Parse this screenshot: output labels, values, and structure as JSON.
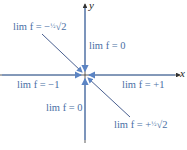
{
  "diagram": {
    "axes": {
      "x_label": "x",
      "y_label": "y"
    },
    "colors": {
      "path": "#5b84c4",
      "axis": "#333333",
      "label": "#4a6fa5"
    },
    "labels": {
      "upper_left": {
        "prefix": "lim f = −",
        "frac": "½",
        "suffix": "√2"
      },
      "upper": "lim f = 0",
      "left": "lim f = −1",
      "right": "lim f = +1",
      "lower": "lim f = 0",
      "lower_right": {
        "prefix": "lim f = +",
        "frac": "½",
        "suffix": "√2"
      }
    }
  }
}
